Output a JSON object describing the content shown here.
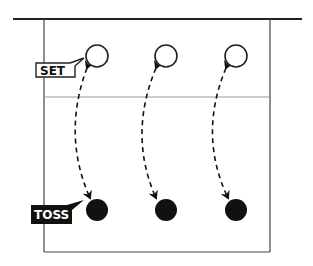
{
  "diagram": {
    "type": "volleyball-set-toss-drill",
    "labels": {
      "set": "SET",
      "toss": "TOSS"
    },
    "colors": {
      "line": "#222222",
      "midline": "#999999",
      "filled_ball": "#111111",
      "open_ball_fill": "#ffffff"
    },
    "setters": [
      {
        "role": "set",
        "x": 97,
        "y": 56
      },
      {
        "role": "set",
        "x": 166,
        "y": 56
      },
      {
        "role": "set",
        "x": 236,
        "y": 56
      }
    ],
    "tossers": [
      {
        "role": "toss",
        "x": 97,
        "y": 210
      },
      {
        "role": "toss",
        "x": 166,
        "y": 210
      },
      {
        "role": "toss",
        "x": 236,
        "y": 210
      }
    ],
    "arrows": [
      {
        "from": "set-1",
        "to": "toss-1",
        "style": "dashed",
        "bidirectional": true
      },
      {
        "from": "set-2",
        "to": "toss-2",
        "style": "dashed",
        "bidirectional": true
      },
      {
        "from": "set-3",
        "to": "toss-3",
        "style": "dashed",
        "bidirectional": true
      }
    ]
  }
}
